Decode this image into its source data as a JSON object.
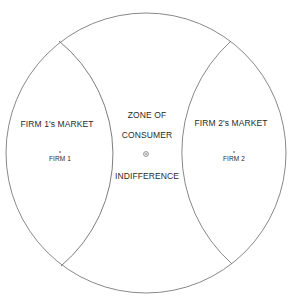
{
  "diagram": {
    "type": "market-area-circle",
    "outer_circle": {
      "cx": 146,
      "cy": 153,
      "r": 140
    },
    "left_arc": {
      "x1": 59,
      "y1": 41,
      "x2": 61,
      "y2": 266,
      "r": 146
    },
    "right_arc": {
      "x1": 231,
      "y1": 41,
      "x2": 232,
      "y2": 264,
      "r": 150
    },
    "line_color": "#7a7a7a",
    "text_color": "#2a2a2a"
  },
  "regions": {
    "firm1_market": {
      "label": "FIRM 1's MARKET",
      "firm_label": "FIRM 1"
    },
    "zone": {
      "line1": "ZONE OF",
      "line2": "CONSUMER",
      "line3": "INDIFFERENCE",
      "center_marker": "⊙"
    },
    "firm2_market": {
      "label": "FIRM 2's MARKET",
      "firm_label": "FIRM 2"
    }
  }
}
